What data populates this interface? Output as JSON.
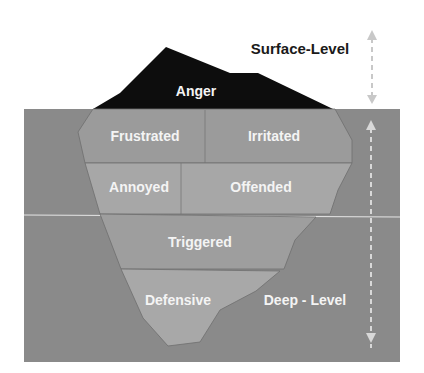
{
  "diagram": {
    "colors": {
      "water": "#8a8a8a",
      "iceberg_tip": "#0d0d0d",
      "ice_light": "#a5a5a5",
      "ice_mid": "#9a9a9a",
      "arrow": "#c8c8c8",
      "background": "#ffffff"
    },
    "levels": {
      "surface": "Surface-Level",
      "deep": "Deep - Level"
    },
    "tip": {
      "label": "Anger"
    },
    "layers": [
      {
        "labels": [
          "Frustrated",
          "Irritated"
        ]
      },
      {
        "labels": [
          "Annoyed",
          "Offended"
        ]
      },
      {
        "labels": [
          "Triggered"
        ]
      },
      {
        "labels": [
          "Defensive"
        ]
      }
    ]
  }
}
